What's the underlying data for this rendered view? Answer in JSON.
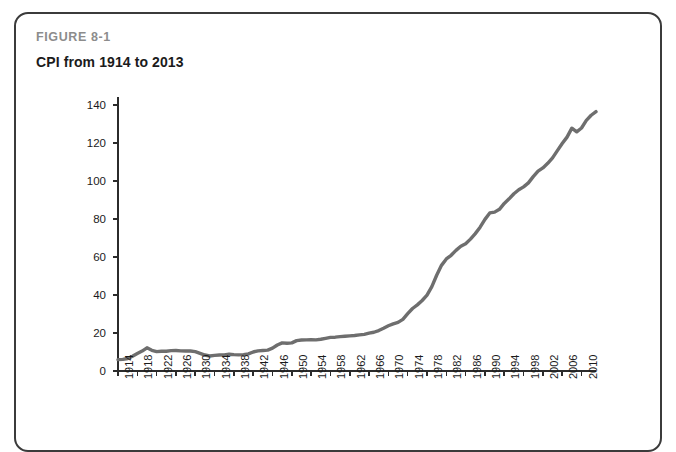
{
  "figure": {
    "label": "FIGURE 8-1",
    "title": "CPI from 1914 to 2013"
  },
  "colors": {
    "line": "#6e6e6e",
    "axis": "#2b2b2b",
    "card_border": "#3b3b3b",
    "label_gray": "#8c8c8c",
    "title_black": "#1b1b1b",
    "background": "#ffffff"
  },
  "chart_data": {
    "type": "line",
    "title": "CPI from 1914 to 2013",
    "xlabel": "",
    "ylabel": "",
    "xlim": [
      1914,
      2013
    ],
    "ylim": [
      0,
      140
    ],
    "yticks": [
      0,
      20,
      40,
      60,
      80,
      100,
      120,
      140
    ],
    "xticks": [
      1914,
      1918,
      1922,
      1926,
      1930,
      1934,
      1938,
      1942,
      1946,
      1950,
      1954,
      1958,
      1962,
      1966,
      1970,
      1974,
      1978,
      1982,
      1986,
      1990,
      1994,
      1998,
      2002,
      2006,
      2010
    ],
    "grid": false,
    "legend": null,
    "series": [
      {
        "name": "CPI",
        "x": [
          1914,
          1915,
          1916,
          1917,
          1918,
          1919,
          1920,
          1921,
          1922,
          1923,
          1924,
          1925,
          1926,
          1927,
          1928,
          1929,
          1930,
          1931,
          1932,
          1933,
          1934,
          1935,
          1936,
          1937,
          1938,
          1939,
          1940,
          1941,
          1942,
          1943,
          1944,
          1945,
          1946,
          1947,
          1948,
          1949,
          1950,
          1951,
          1952,
          1953,
          1954,
          1955,
          1956,
          1957,
          1958,
          1959,
          1960,
          1961,
          1962,
          1963,
          1964,
          1965,
          1966,
          1967,
          1968,
          1969,
          1970,
          1971,
          1972,
          1973,
          1974,
          1975,
          1976,
          1977,
          1978,
          1979,
          1980,
          1981,
          1982,
          1983,
          1984,
          1985,
          1986,
          1987,
          1988,
          1989,
          1990,
          1991,
          1992,
          1993,
          1994,
          1995,
          1996,
          1997,
          1998,
          1999,
          2000,
          2001,
          2002,
          2003,
          2004,
          2005,
          2006,
          2007,
          2008,
          2009,
          2010,
          2011,
          2012,
          2013
        ],
        "values": [
          6.0,
          6.1,
          6.6,
          7.8,
          9.2,
          10.5,
          12.2,
          10.9,
          10.2,
          10.4,
          10.4,
          10.7,
          10.8,
          10.6,
          10.5,
          10.5,
          10.2,
          9.3,
          8.4,
          7.9,
          8.2,
          8.4,
          8.5,
          8.8,
          8.6,
          8.5,
          8.6,
          9.0,
          10.0,
          10.6,
          10.8,
          11.0,
          12.0,
          13.7,
          14.8,
          14.6,
          14.8,
          16.0,
          16.3,
          16.4,
          16.5,
          16.4,
          16.7,
          17.2,
          17.7,
          17.8,
          18.1,
          18.3,
          18.5,
          18.7,
          19.0,
          19.3,
          19.9,
          20.4,
          21.3,
          22.5,
          23.8,
          24.8,
          25.6,
          27.2,
          30.2,
          32.9,
          34.8,
          37.1,
          39.9,
          44.4,
          50.4,
          55.6,
          59.0,
          60.9,
          63.5,
          65.7,
          67.0,
          69.4,
          72.3,
          75.7,
          79.8,
          83.2,
          83.6,
          85.1,
          88.2,
          90.6,
          93.3,
          95.4,
          96.9,
          99.0,
          102.3,
          105.2,
          106.9,
          109.3,
          112.2,
          116.0,
          119.7,
          123.1,
          127.8,
          125.9,
          127.9,
          131.9,
          134.6,
          136.5
        ]
      }
    ]
  }
}
